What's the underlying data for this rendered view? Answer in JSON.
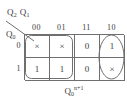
{
  "figure": {
    "kind": "karnaugh-map",
    "col_var_label": "Q2 Q1",
    "col_var_base": "Q",
    "col_var_sub_a": "2",
    "col_var_sub_b": "1",
    "row_var_base": "Q",
    "row_var_sub": "0",
    "output_base": "Q",
    "output_sub": "0",
    "output_sup": "n+1",
    "line_color": "#6f6f6f",
    "text_color": "#3d3d3d",
    "background": "#ffffff"
  },
  "column_headers": [
    "00",
    "01",
    "11",
    "10"
  ],
  "row_headers": [
    "0",
    "1"
  ],
  "cells": [
    [
      "×",
      "×",
      "0",
      "1"
    ],
    [
      "1",
      "1",
      "0",
      "×"
    ]
  ],
  "groups": [
    {
      "name": "group-left-columns",
      "shape": "rounded-rectangle",
      "covers": [
        "r0c0",
        "r0c1",
        "r1c0",
        "r1c1"
      ]
    },
    {
      "name": "group-right-column",
      "shape": "oval",
      "covers": [
        "r0c3",
        "r1c3"
      ]
    }
  ]
}
